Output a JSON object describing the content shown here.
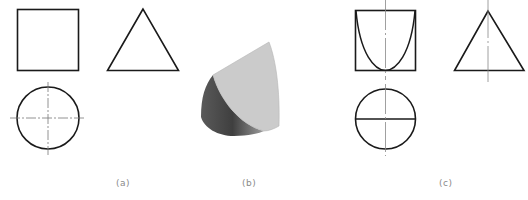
{
  "figure": {
    "panels": [
      {
        "id": "a",
        "label": "(a)",
        "description": "Three-view drawing: front view square, side view triangle, top view circle with center lines"
      },
      {
        "id": "b",
        "label": "(b)",
        "description": "Isometric shaded solid: cylinder cut by a curved surface"
      },
      {
        "id": "c",
        "label": "(c)",
        "description": "Three-view drawing with intersection curve: square with U-shaped curve, triangle, circle with horizontal diameter"
      }
    ]
  },
  "colors": {
    "line": "#1a1a1a",
    "center_line": "#888888",
    "light_face": "#cbcbcb",
    "dark_face_start": "#4a4a4a",
    "dark_face_end": "#a8a8a8",
    "label": "#8a8a8a"
  }
}
